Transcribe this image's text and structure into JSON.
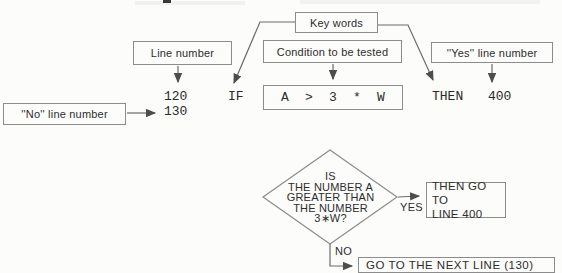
{
  "colors": {
    "background": "#fcfcfb",
    "box_border": "#8c8c8c",
    "connector_line": "#6b6b6b",
    "arrowhead": "#4d4d4d",
    "text": "#2d2d2d"
  },
  "statement": {
    "labels": {
      "key_words": "Key words",
      "line_number": "Line number",
      "condition": "Condition to be tested",
      "yes_line": "''Yes'' line number",
      "no_line": "''No'' line number"
    },
    "code": {
      "line_number": "120",
      "if_keyword": "IF",
      "condition": "A  >  3  *  W",
      "then_keyword": "THEN",
      "yes_line_number": "400",
      "no_line_number": "130"
    }
  },
  "flowchart": {
    "decision_text": "IS\nTHE NUMBER A\nGREATER THAN\nTHE NUMBER\n3∗W?",
    "yes_label": "YES",
    "no_label": "NO",
    "yes_outcome": "THEN GO TO\nLINE 400",
    "no_outcome": "GO TO THE NEXT LINE (130)"
  }
}
